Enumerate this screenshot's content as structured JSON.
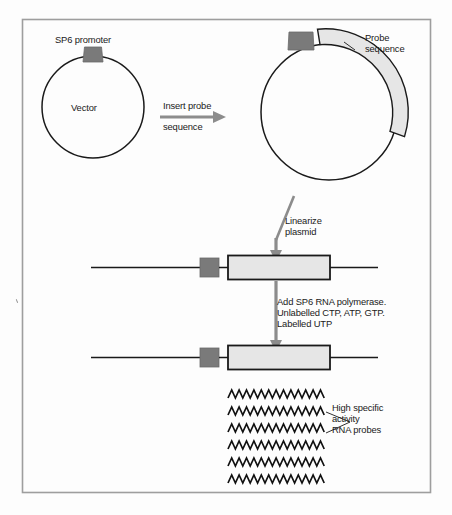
{
  "figure": {
    "border_color": "#9a9a9a",
    "background": "#fdfdfd"
  },
  "palette": {
    "promoter_fill": "#7a7a7a",
    "promoter_stroke": "#5a5a5a",
    "probe_fill": "#e6e6e6",
    "probe_stroke": "#1a1a1a",
    "arrow_gray": "#8c8c8c",
    "line_black": "#1a1a1a",
    "text": "#1a1a1a"
  },
  "labels": {
    "sp6_promoter": "SP6 promoter",
    "vector": "Vector",
    "insert_line1": "Insert probe",
    "insert_line2": "sequence",
    "probe_sequence_line1": "Probe",
    "probe_sequence_line2": "sequence",
    "linearize_line1": "Linearize",
    "linearize_line2": "plasmid",
    "add_sp6_line1": "Add SP6 RNA polymerase.",
    "add_sp6_line2": "Unlabelled CTP, ATP, GTP.",
    "add_sp6_line3": "Labelled UTP",
    "high_specific_line1": "High specific",
    "high_specific_line2": "activity",
    "high_specific_line3": "RNA probes"
  },
  "diagram": {
    "type": "process-flow",
    "steps": [
      {
        "id": "vector-plasmid",
        "name": "Vector plasmid",
        "shape": "circle",
        "center_x": 93,
        "center_y": 107,
        "radius": 51,
        "features": [
          "SP6 promoter"
        ]
      },
      {
        "id": "recombinant-plasmid",
        "name": "Recombinant plasmid with probe insert",
        "shape": "circle",
        "center_x": 329,
        "center_y": 112,
        "radius": 68,
        "features": [
          "SP6 promoter",
          "Probe sequence arc"
        ]
      },
      {
        "id": "linear-template-1",
        "name": "Linearized plasmid template",
        "shape": "linear-construct",
        "y": 267,
        "features": [
          "SP6 promoter box",
          "Probe sequence box"
        ]
      },
      {
        "id": "linear-template-2",
        "name": "Template during transcription",
        "shape": "linear-construct",
        "y": 357,
        "features": [
          "SP6 promoter box",
          "Probe sequence box"
        ]
      },
      {
        "id": "rna-probes",
        "name": "Labelled RNA probe transcripts",
        "shape": "zigzag-strands",
        "strand_count": 6,
        "peaks_per_strand": 13
      }
    ],
    "arrows": [
      {
        "id": "insert-arrow",
        "label": "Insert probe sequence",
        "direction": "right"
      },
      {
        "id": "linearize-arrow",
        "label": "Linearize plasmid",
        "direction": "down"
      },
      {
        "id": "transcribe-arrow",
        "label": "Add SP6 RNA polymerase. Unlabelled CTP, ATP, GTP. Labelled UTP",
        "direction": "down"
      }
    ]
  }
}
